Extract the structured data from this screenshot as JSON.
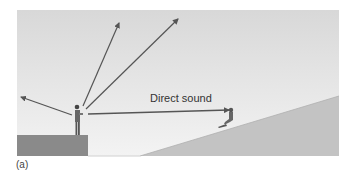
{
  "figure": {
    "caption": "(a)",
    "labels": {
      "direct_sound": "Direct sound"
    },
    "colors": {
      "sky_top": "#d9d9d9",
      "sky_bottom": "#f0f0f0",
      "stage": "#8c8c8c",
      "hill": "#c4c4c4",
      "arrow": "#555555",
      "figure": "#555555"
    }
  }
}
